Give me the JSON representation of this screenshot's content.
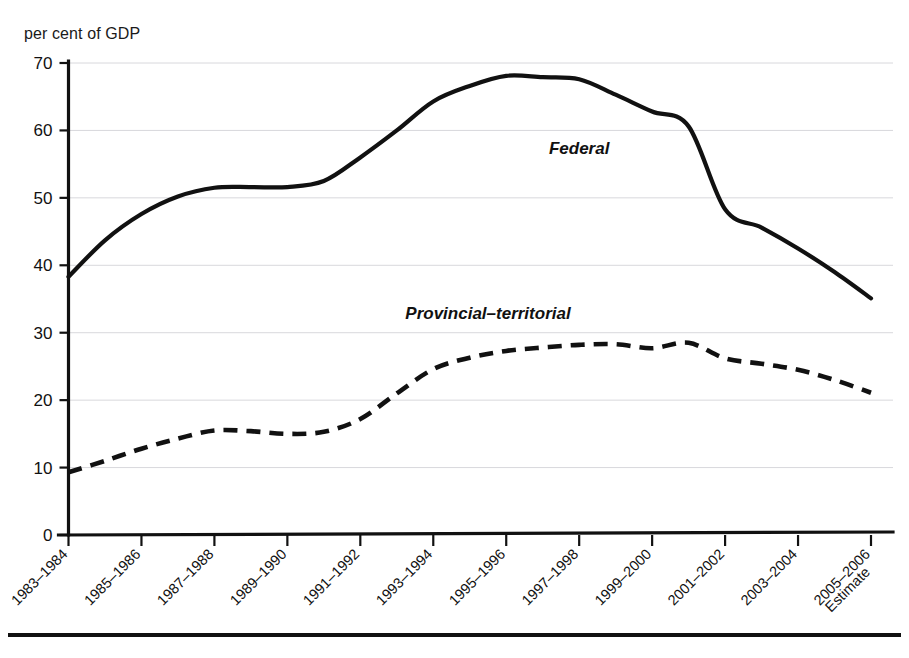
{
  "chart_data": {
    "type": "line",
    "title": "",
    "subtitle": "",
    "xlabel": "",
    "ylabel": "per cent of GDP",
    "ylim": [
      0,
      70
    ],
    "ytick_step": 10,
    "yticks": [
      "0",
      "10",
      "20",
      "30",
      "40",
      "50",
      "60",
      "70"
    ],
    "grid": true,
    "grid_axis": "y",
    "legend_position": "inline-labels",
    "categories": [
      "1983–1984",
      "1984–1985",
      "1985–1986",
      "1986–1987",
      "1987–1988",
      "1988–1989",
      "1989–1990",
      "1990–1991",
      "1991–1992",
      "1992–1993",
      "1993–1994",
      "1994–1995",
      "1995–1996",
      "1996–1997",
      "1997–1998",
      "1998–1999",
      "1999–2000",
      "2000–2001",
      "2001–2002",
      "2002–2003",
      "2003–2004",
      "2004–2005",
      "2005–2006"
    ],
    "xtick_labels": [
      "1983–1984",
      "1985–1986",
      "1987–1988",
      "1989–1990",
      "1991–1992",
      "1993–1994",
      "1995–1996",
      "1997–1998",
      "1999–2000",
      "2001–2002",
      "2003–2004",
      "2005–2006"
    ],
    "xtick_label_last_suffix": "Estimate",
    "series": [
      {
        "name": "Federal",
        "style": "solid",
        "color": "#111111",
        "values": [
          38.3,
          43.7,
          47.6,
          50.2,
          51.5,
          51.6,
          51.6,
          52.5,
          56.0,
          60.0,
          64.3,
          66.6,
          68.1,
          67.9,
          67.6,
          65.3,
          62.8,
          60.6,
          48.3,
          45.6,
          42.5,
          39.0,
          35.1
        ]
      },
      {
        "name": "Provincial–territorial",
        "style": "dashed",
        "color": "#111111",
        "values": [
          9.3,
          11.0,
          12.8,
          14.3,
          15.5,
          15.4,
          15.0,
          15.3,
          17.2,
          21.0,
          24.6,
          26.3,
          27.3,
          27.8,
          28.2,
          28.3,
          27.7,
          28.5,
          26.2,
          25.4,
          24.5,
          23.0,
          21.1
        ]
      }
    ],
    "annotations": [
      {
        "text": "Federal",
        "x_index": 14.0,
        "y_value": 56.5
      },
      {
        "text": "Provincial–territorial",
        "x_index": 11.5,
        "y_value": 32.0
      }
    ]
  },
  "figure": {
    "y_axis_caption": "per cent of GDP"
  }
}
